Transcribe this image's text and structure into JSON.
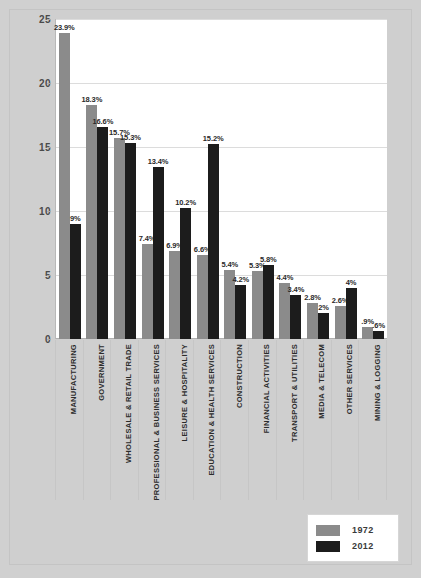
{
  "chart_data": {
    "type": "bar",
    "title": "",
    "subtitle": "",
    "xlabel": "",
    "ylabel": "",
    "ylim": [
      0,
      25
    ],
    "yticks": [
      "0",
      "5",
      "10",
      "15",
      "20",
      "25"
    ],
    "ytick_values": [
      0,
      5,
      10,
      15,
      20,
      25
    ],
    "grid": true,
    "legend_position": "bottom-right",
    "categories": [
      "MANUFACTURING",
      "GOVERNMENT",
      "WHOLESALE & RETAIL TRADE",
      "PROFESSIONAL & BUSINESS SERVICES",
      "LEISURE & HOSPITALITY",
      "EDUCATION & HEALTH SERVICES",
      "CONSTRUCTION",
      "FINANCIAL ACTIVITIES",
      "TRANSPORT & UTILITIES",
      "MEDIA & TELECOM",
      "OTHER SERVICES",
      "MINING & LOGGING"
    ],
    "series": [
      {
        "name": "1972",
        "color": "#8b8b8b",
        "values": [
          23.9,
          18.3,
          15.7,
          7.4,
          6.9,
          6.6,
          5.4,
          5.3,
          4.4,
          2.8,
          2.6,
          0.9
        ],
        "labels": [
          "23.9%",
          "18.3%",
          "15.7%",
          "7.4%",
          "6.9%",
          "6.6%",
          "5.4%",
          "5.3%",
          "4.4%",
          "2.8%",
          "2.6%",
          ".9%"
        ]
      },
      {
        "name": "2012",
        "color": "#1c1c1c",
        "values": [
          9.0,
          16.6,
          15.3,
          13.4,
          10.2,
          15.2,
          4.2,
          5.8,
          3.4,
          2.0,
          4.0,
          0.6
        ],
        "labels": [
          "9%",
          "16.6%",
          "15.3%",
          "13.4%",
          "10.2%",
          "15.2%",
          "4.2%",
          "5.8%",
          "3.4%",
          "2%",
          "4%",
          ".6%"
        ]
      }
    ]
  },
  "legend": {
    "entries": [
      {
        "label": "1972",
        "color": "#8b8b8b"
      },
      {
        "label": "2012",
        "color": "#1c1c1c"
      }
    ]
  },
  "colors": {
    "series_1972": "#8b8b8b",
    "series_2012": "#1c1c1c",
    "figure_background": "#cfcfcf",
    "plot_background": "#ffffff",
    "gridline": "#dcdcdc",
    "label_text": "#2b2b2b"
  }
}
